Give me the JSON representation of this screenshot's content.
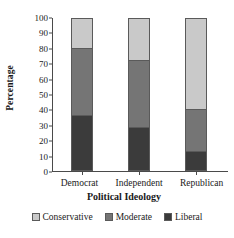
{
  "chart_data": {
    "type": "bar",
    "subtype": "stacked-bar-100",
    "title": "",
    "xlabel": "Political Ideology",
    "ylabel": "Percentage",
    "categories": [
      "Democrat",
      "Independent",
      "Republican"
    ],
    "series": [
      {
        "name": "Conservative",
        "values": [
          20,
          28,
          60
        ],
        "color": "#c9c9c9"
      },
      {
        "name": "Moderate",
        "values": [
          44,
          44,
          28
        ],
        "color": "#757575"
      },
      {
        "name": "Liberal",
        "values": [
          36,
          28,
          12
        ],
        "color": "#3b3b3b"
      }
    ],
    "stack_order_top_to_bottom": [
      "Conservative",
      "Moderate",
      "Liberal"
    ],
    "cumulative_boundaries": {
      "Democrat": {
        "liberal_top": 36,
        "moderate_top": 80,
        "conservative_top": 100
      },
      "Independent": {
        "liberal_top": 28,
        "moderate_top": 72,
        "conservative_top": 100
      },
      "Republican": {
        "liberal_top": 12,
        "moderate_top": 40,
        "conservative_top": 100
      }
    },
    "ylim": [
      0,
      100
    ],
    "ytick_labels": [
      "100",
      "90",
      "80",
      "70",
      "60",
      "50",
      "40",
      "30",
      "20",
      "10",
      "0"
    ],
    "ytick_values": [
      100,
      90,
      80,
      70,
      60,
      50,
      40,
      30,
      20,
      10,
      0
    ],
    "grid": false,
    "legend_position": "bottom"
  },
  "legend": {
    "items": [
      {
        "label": "Conservative",
        "color": "#c9c9c9"
      },
      {
        "label": "Moderate",
        "color": "#757575"
      },
      {
        "label": "Liberal",
        "color": "#3b3b3b"
      }
    ]
  }
}
